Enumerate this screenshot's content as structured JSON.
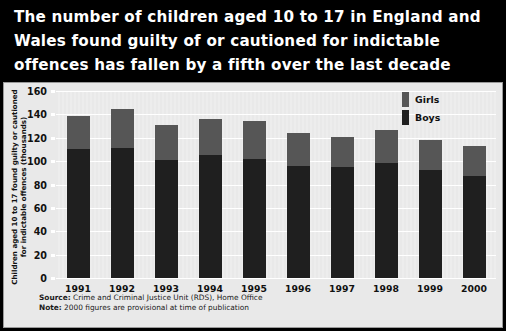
{
  "headline": {
    "lines": [
      "The number of children aged 10 to 17 in England and",
      "Wales found guilty of or cautioned for indictable",
      "offences has fallen by a fifth over the last decade"
    ]
  },
  "yaxis_caption": {
    "line1": "Children aged 10 to 17 found guilty or cautioned",
    "line2": "for indictable offences (thousands)"
  },
  "footnotes": {
    "source_label": "Source:",
    "source_text": " Crime and Criminal Justice Unit (RDS), Home Office",
    "note_label": "Note:",
    "note_text": " 2000 figures are provisional at time of publication"
  },
  "colors": {
    "headline_bg": "#000000",
    "headline_text": "#ffffff",
    "panel_bg": "#e9e9e9",
    "boys": "#1f1f1f",
    "girls": "#565656",
    "gridline": "#ffffff"
  },
  "chart_data": {
    "type": "bar",
    "title": "The number of children aged 10 to 17 in England and Wales found guilty of or cautioned for indictable offences has fallen by a fifth over the last decade",
    "stacked": true,
    "xlabel": "",
    "ylabel": "Children aged 10 to 17 found guilty or cautioned for indictable offences (thousands)",
    "categories": [
      "1991",
      "1992",
      "1993",
      "1994",
      "1995",
      "1996",
      "1997",
      "1998",
      "1999",
      "2000"
    ],
    "series": [
      {
        "name": "Boys",
        "values": [
          110,
          111,
          101,
          105,
          102,
          96,
          95,
          98,
          92,
          87
        ]
      },
      {
        "name": "Girls",
        "values": [
          29,
          34,
          30,
          31,
          32,
          28,
          26,
          29,
          26,
          26
        ]
      }
    ],
    "totals": [
      139,
      145,
      131,
      136,
      134,
      124,
      121,
      127,
      118,
      113
    ],
    "ylim": [
      0,
      160
    ],
    "yticks": [
      0,
      20,
      40,
      60,
      80,
      100,
      120,
      140,
      160
    ],
    "ytick_labels": [
      "0",
      "20",
      "40",
      "60",
      "80",
      "100",
      "120",
      "140",
      "160"
    ],
    "grid": true,
    "legend_position": "top-right",
    "legend": [
      "Girls",
      "Boys"
    ]
  }
}
